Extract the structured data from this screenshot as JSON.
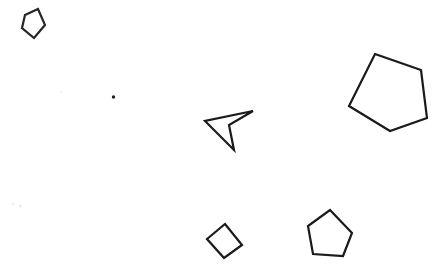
{
  "canvas": {
    "width": 439,
    "height": 272,
    "background_color": "#ffffff",
    "stroke_color": "#1a1a1a",
    "faint_color": "#eeeeee"
  },
  "shapes": [
    {
      "id": "pentagon-small-top-left",
      "name": "small-pentagon-top-left",
      "type": "pentagon",
      "stroke_color": "#262626",
      "stroke_width": 2.2,
      "fill": "none",
      "points": "25,15 38,9 45,25 34,38 22,28"
    },
    {
      "id": "dot-center-left",
      "name": "small-dot-marker",
      "type": "dot",
      "fill_color": "#1f1f1f",
      "cx": 113.5,
      "cy": 97,
      "r": 1.7
    },
    {
      "id": "dart-center",
      "name": "arrow-dart-center",
      "type": "concave-quadrilateral",
      "stroke_color": "#1a1a1a",
      "stroke_width": 2.2,
      "fill": "none",
      "points": "253,111 229,125 234,150 205,121"
    },
    {
      "id": "pentagon-large-right",
      "name": "large-pentagon-right",
      "type": "pentagon",
      "stroke_color": "#1a1a1a",
      "stroke_width": 2.2,
      "fill": "none",
      "points": "375,54 421,70 427,118 390,131 349,106"
    },
    {
      "id": "quad-bottom-center",
      "name": "rotated-quadrilateral-bottom-center",
      "type": "quadrilateral",
      "stroke_color": "#1a1a1a",
      "stroke_width": 2.2,
      "fill": "none",
      "points": "225,224 242,245 224,258 207,239"
    },
    {
      "id": "pentagon-bottom-right",
      "name": "pentagon-bottom-right",
      "type": "pentagon",
      "stroke_color": "#1a1a1a",
      "stroke_width": 2.2,
      "fill": "none",
      "points": "330,210 352,233 343,256 313,254 308,226"
    }
  ],
  "faint_marks": [
    {
      "id": "faint-speck-a",
      "name": "faint-speck-left",
      "cx": 13,
      "cy": 204,
      "r": 1.6,
      "color": "#f0f0f0"
    },
    {
      "id": "faint-speck-b",
      "name": "faint-speck-right",
      "cx": 20.5,
      "cy": 206,
      "r": 1.6,
      "color": "#ececec"
    },
    {
      "id": "faint-speck-c",
      "name": "faint-speck-upper",
      "cx": 61,
      "cy": 92,
      "r": 1.4,
      "color": "#f6f6f6"
    }
  ]
}
